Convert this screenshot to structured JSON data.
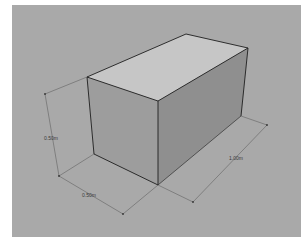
{
  "diagram": {
    "type": "3d-box-with-dimensions",
    "colors": {
      "viewport_background": "#a9a9a9",
      "top_face": "#c6c6c6",
      "front_face": "#9d9d9d",
      "side_face": "#8f8f8f",
      "edge": "#1e1e1e",
      "dimension_line": "#555555"
    },
    "dimensions": {
      "height": {
        "label": "0.50m"
      },
      "depth": {
        "label": "0.50m"
      },
      "length": {
        "label": "1.00m"
      }
    }
  }
}
